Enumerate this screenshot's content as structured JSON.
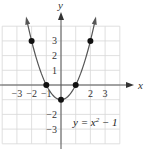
{
  "chart_data": {
    "type": "line",
    "title": "",
    "equation": "y = x² − 1",
    "equation_parts": {
      "lhs": "y = x",
      "exp": "2",
      "rhs": " − 1"
    },
    "xlabel": "x",
    "ylabel": "y",
    "xlim": [
      -4,
      4
    ],
    "ylim": [
      -4,
      4
    ],
    "grid": true,
    "x_tick_labels": [
      "−3",
      "−2",
      "−1",
      "2",
      "3"
    ],
    "x_tick_values": [
      -3,
      -2,
      -1,
      2,
      3
    ],
    "y_tick_labels": [
      "3",
      "2",
      "1",
      "−2",
      "−3"
    ],
    "y_tick_values": [
      3,
      2,
      1,
      -2,
      -3
    ],
    "points": [
      {
        "x": -2,
        "y": 3
      },
      {
        "x": -1,
        "y": 0
      },
      {
        "x": 0,
        "y": -1
      },
      {
        "x": 1,
        "y": 0
      },
      {
        "x": 2,
        "y": 3
      }
    ],
    "curve_color": "#555555",
    "point_color": "#111111",
    "grid_color": "#d8d8d8"
  }
}
